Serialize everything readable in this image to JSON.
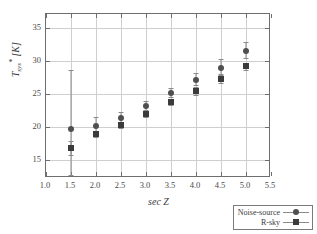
{
  "chart_data": {
    "type": "scatter",
    "title": "",
    "xlabel": "sec Z",
    "ylabel": "T_sys* [K]",
    "ylabel_parts": {
      "base": "T",
      "sub": "sys",
      "sup": "*",
      "unit": " [K]"
    },
    "xlim": [
      1.0,
      5.5
    ],
    "ylim": [
      12.2,
      37.2
    ],
    "xticks": [
      "1.0",
      "1.5",
      "2.0",
      "2.5",
      "3.0",
      "3.5",
      "4.0",
      "4.5",
      "5.0",
      "5.5"
    ],
    "xtick_values": [
      1.0,
      1.5,
      2.0,
      2.5,
      3.0,
      3.5,
      4.0,
      4.5,
      5.0,
      5.5
    ],
    "yticks": [
      "15",
      "20",
      "25",
      "30",
      "35"
    ],
    "ytick_values": [
      15,
      20,
      25,
      30,
      35
    ],
    "grid": true,
    "legend_position": "lower right",
    "series": [
      {
        "name": "Noise-source",
        "marker": "circle",
        "color": "#4f4f4f",
        "x": [
          1.5,
          2.0,
          2.5,
          3.0,
          3.5,
          4.0,
          4.5,
          5.0
        ],
        "y": [
          19.6,
          20.2,
          21.4,
          23.1,
          25.1,
          27.1,
          29.0,
          31.6
        ],
        "yerr_low": [
          6.9,
          1.3,
          0.7,
          0.6,
          0.6,
          0.7,
          0.9,
          1.1
        ],
        "yerr_high": [
          9.0,
          1.3,
          0.9,
          0.8,
          0.8,
          1.1,
          1.3,
          1.3
        ]
      },
      {
        "name": "R-sky",
        "marker": "square",
        "color": "#3b3b3b",
        "x": [
          1.5,
          2.0,
          2.5,
          3.0,
          3.5,
          4.0,
          4.5,
          5.0
        ],
        "y": [
          16.8,
          18.9,
          20.3,
          21.9,
          23.8,
          25.4,
          27.3,
          29.2
        ],
        "yerr_low": [
          1.1,
          0.5,
          0.5,
          0.4,
          0.5,
          0.6,
          0.6,
          0.6
        ],
        "yerr_high": [
          1.1,
          0.5,
          0.5,
          0.4,
          0.5,
          0.6,
          0.6,
          0.6
        ]
      }
    ]
  },
  "legend": {
    "items": [
      {
        "label": "Noise-source",
        "marker": "circle"
      },
      {
        "label": "R-sky",
        "marker": "square"
      }
    ]
  },
  "colors": {
    "frame": "#6e6e6e",
    "grid": "#cfcfcf",
    "errorbar": "#8a8a8a",
    "noise_source": "#4f4f4f",
    "r_sky": "#3b3b3b",
    "background": "#ffffff"
  }
}
